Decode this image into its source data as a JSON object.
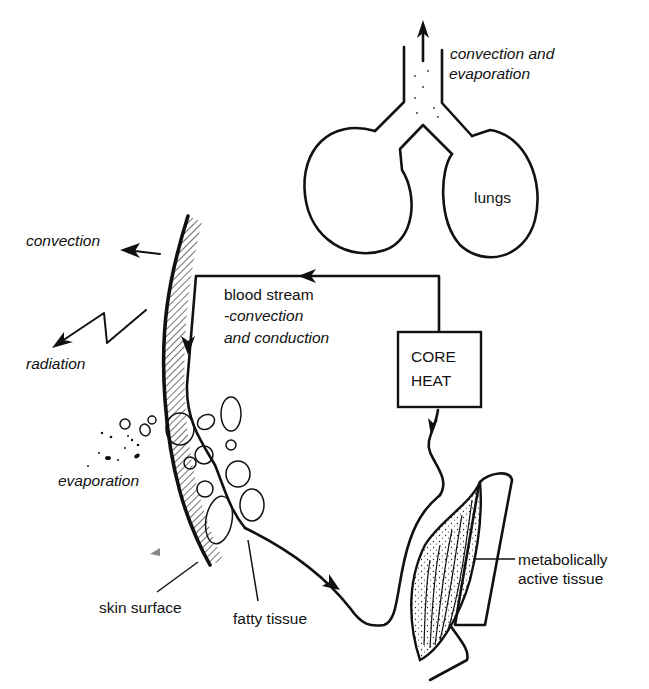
{
  "diagram": {
    "labels": {
      "lungs_output": "convection and",
      "lungs_output_2": "evaporation",
      "lungs": "lungs",
      "convection": "convection",
      "radiation": "radiation",
      "blood_stream": "blood stream",
      "blood_stream_sub1": "-convection",
      "blood_stream_sub2": "and conduction",
      "core_heat_1": "CORE",
      "core_heat_2": "HEAT",
      "evaporation": "evaporation",
      "skin_surface": "skin surface",
      "fatty_tissue": "fatty tissue",
      "metabolic_1": "metabolically",
      "metabolic_2": "active tissue"
    },
    "colors": {
      "ink": "#111111",
      "background": "#ffffff"
    },
    "flow": [
      "metabolically active tissue",
      "core heat",
      "blood stream",
      "skin surface",
      "convection / radiation / evaporation"
    ]
  }
}
